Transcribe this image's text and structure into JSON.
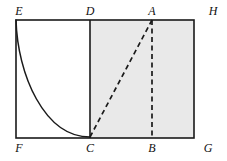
{
  "figure": {
    "kind": "geometry-diagram",
    "canvas": {
      "width": 227,
      "height": 161
    },
    "background_color": "#ffffff",
    "stroke_color": "#1a1a1a",
    "shade_color": "#e9e9e9",
    "shade_border_color": "#cfcfcf"
  },
  "geometry": {
    "rectangle_EFGH": {
      "name": "outer-rectangle",
      "left": 16,
      "top": 20,
      "right": 194,
      "bottom": 138,
      "stroke_width": 1.6
    },
    "segment_DC": {
      "name": "vertical-divider",
      "x": 90,
      "y_top": 20,
      "y_bottom": 138,
      "style": "solid",
      "stroke_width": 1.6
    },
    "shaded_region_DCGH": {
      "name": "shaded-rectangle",
      "x": 90,
      "y": 20,
      "width": 104,
      "height": 118,
      "fill": "#e9e9e9"
    },
    "curve_EC": {
      "name": "convex-decreasing-curve",
      "style": "solid",
      "stroke_width": 1.5,
      "start": {
        "x": 16,
        "y": 20
      },
      "end": {
        "x": 90,
        "y": 137
      },
      "control_1": {
        "x": 17.5,
        "y": 74
      },
      "control_2": {
        "x": 44,
        "y": 137
      }
    },
    "segment_CA": {
      "name": "dashed-hypotenuse",
      "from": {
        "x": 90,
        "y": 137
      },
      "to": {
        "x": 152,
        "y": 20
      },
      "style": "dashed",
      "dash_pattern": "5,3.5",
      "stroke_width": 1.7
    },
    "segment_AB": {
      "name": "dashed-altitude",
      "from": {
        "x": 152,
        "y": 20
      },
      "to": {
        "x": 152,
        "y": 138
      },
      "style": "dashed",
      "dash_pattern": "5,3.5",
      "stroke_width": 1.7
    }
  },
  "labels": [
    {
      "id": "label-E",
      "text": "E",
      "x": 19,
      "y": 11,
      "anchor_vertex": "E",
      "position": "above-left-corner"
    },
    {
      "id": "label-D",
      "text": "D",
      "x": 90,
      "y": 11,
      "anchor_vertex": "D",
      "position": "above-top-edge"
    },
    {
      "id": "label-A",
      "text": "A",
      "x": 152,
      "y": 11,
      "anchor_vertex": "A",
      "position": "above-top-edge"
    },
    {
      "id": "label-H",
      "text": "H",
      "x": 213,
      "y": 11,
      "anchor_vertex": "H",
      "position": "above-right-corner"
    },
    {
      "id": "label-F",
      "text": "F",
      "x": 19,
      "y": 148,
      "anchor_vertex": "F",
      "position": "below-left-corner"
    },
    {
      "id": "label-C",
      "text": "C",
      "x": 90,
      "y": 148,
      "anchor_vertex": "C",
      "position": "below-bottom-edge"
    },
    {
      "id": "label-B",
      "text": "B",
      "x": 152,
      "y": 148,
      "anchor_vertex": "B",
      "position": "below-bottom-edge"
    },
    {
      "id": "label-G",
      "text": "G",
      "x": 208,
      "y": 148,
      "anchor_vertex": "G",
      "position": "below-right-corner"
    }
  ]
}
